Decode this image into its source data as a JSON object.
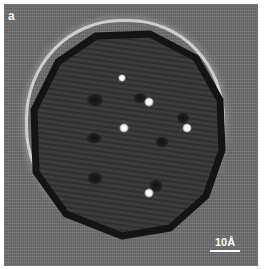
{
  "figure": {
    "panel_label": "a",
    "scale_bar": {
      "label": "10Å"
    },
    "colors": {
      "background": "#6e6e6e",
      "particle_interior": "#3a3a3a",
      "particle_edge": "#151515",
      "halo": "#e6e6e6",
      "bright_spot": "#ffffff",
      "dark_blob": "#1a1a1a"
    },
    "bright_spots": [
      {
        "x": 122,
        "y": 78,
        "r": 4
      },
      {
        "x": 149,
        "y": 102,
        "r": 5
      },
      {
        "x": 124,
        "y": 128,
        "r": 5
      },
      {
        "x": 187,
        "y": 128,
        "r": 5
      },
      {
        "x": 149,
        "y": 193,
        "r": 5
      }
    ],
    "dark_blobs": [
      {
        "x": 95,
        "y": 100,
        "rx": 9,
        "ry": 7
      },
      {
        "x": 140,
        "y": 98,
        "rx": 7,
        "ry": 6
      },
      {
        "x": 183,
        "y": 118,
        "rx": 7,
        "ry": 6
      },
      {
        "x": 94,
        "y": 138,
        "rx": 8,
        "ry": 6
      },
      {
        "x": 162,
        "y": 142,
        "rx": 7,
        "ry": 6
      },
      {
        "x": 95,
        "y": 178,
        "rx": 8,
        "ry": 7
      },
      {
        "x": 156,
        "y": 186,
        "rx": 7,
        "ry": 7
      }
    ]
  }
}
